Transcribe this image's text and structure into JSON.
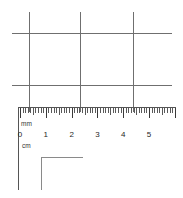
{
  "figure": {
    "background_color": "#ffffff",
    "line_color": "#6f6f6f",
    "tick_color": "#5a5a5a",
    "text_color": "#1f1f1f"
  },
  "ruler": {
    "unit_top_label": "mm",
    "unit_bottom_label": "cm",
    "zero_mark": "0",
    "cm_labels": [
      "0",
      "1",
      "2",
      "3",
      "4",
      "5"
    ],
    "minor_divisions_per_cm": 10,
    "scale_range_cm": [
      0,
      6
    ],
    "origin_x_px": 20,
    "cm_pitch_px": 25.8
  },
  "grid": {
    "horizontal_lines_y": [
      33,
      85
    ],
    "vertical_lines_x": [
      29,
      80,
      133
    ],
    "h_line_extent_x": [
      12,
      172
    ],
    "v_line_extent_y": [
      12,
      112
    ]
  },
  "corner_bracket": {
    "label": "corner-bracket",
    "corner_x": 41,
    "corner_y": 157,
    "h_end_x": 83,
    "v_end_y": 190
  },
  "ruler_left_edge": {
    "x": 18,
    "y_top": 107,
    "y_bottom": 190
  }
}
